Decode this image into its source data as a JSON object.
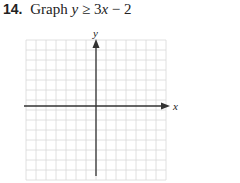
{
  "problem": {
    "number": "14.",
    "instruction": "Graph",
    "inequality": {
      "lhs": "y",
      "operator": "≥",
      "coefficient": "3",
      "variable": "x",
      "minus": "−",
      "constant": "2"
    }
  },
  "graph": {
    "x_axis_label": "x",
    "y_axis_label": "y",
    "grid_columns": 14,
    "grid_rows": 14,
    "grid_color": "#d8d8d8",
    "axis_color": "#333333"
  }
}
